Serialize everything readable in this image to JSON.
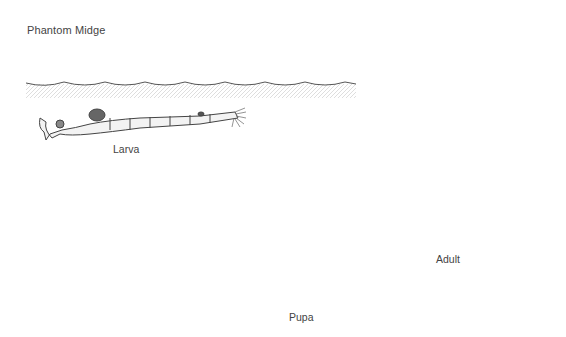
{
  "title": "Phantom Midge",
  "stages": [
    {
      "id": "larva",
      "label": "Larva"
    },
    {
      "id": "pupa",
      "label": "Pupa"
    },
    {
      "id": "adult",
      "label": "Adult"
    }
  ],
  "colors": {
    "ink": "#333333",
    "water": "#d8d8d8",
    "label": "#444444"
  }
}
